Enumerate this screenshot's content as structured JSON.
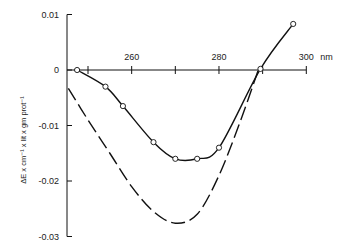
{
  "chart_data": {
    "type": "line",
    "title": "",
    "xlabel": "nm",
    "ylabel": "ΔE x cm⁻¹ x lit x gm prot⁻¹",
    "xlim": [
      245,
      300
    ],
    "ylim": [
      -0.03,
      0.01
    ],
    "x_ticks": [
      {
        "value": 250,
        "label": ""
      },
      {
        "value": 260,
        "label": "260"
      },
      {
        "value": 270,
        "label": ""
      },
      {
        "value": 280,
        "label": "280"
      },
      {
        "value": 290,
        "label": ""
      },
      {
        "value": 300,
        "label": "300"
      }
    ],
    "x_unit_label": "nm",
    "y_ticks": [
      {
        "value": 0.01,
        "label": "0.01"
      },
      {
        "value": 0,
        "label": "0"
      },
      {
        "value": -0.01,
        "label": "-0.01"
      },
      {
        "value": -0.02,
        "label": "-0.02"
      },
      {
        "value": -0.03,
        "label": "-0.03"
      }
    ],
    "grid": false,
    "legend": null,
    "series": [
      {
        "name": "solid-with-circles",
        "style": "solid",
        "marker": "open-circle",
        "x": [
          247.5,
          254,
          258,
          265,
          270,
          275,
          280,
          289.5,
          297
        ],
        "y": [
          0.0,
          -0.003,
          -0.0065,
          -0.013,
          -0.016,
          -0.016,
          -0.014,
          0.0002,
          0.0083
        ]
      },
      {
        "name": "dashed",
        "style": "dashed",
        "marker": "none",
        "x": [
          245.5,
          250,
          255,
          260,
          265,
          270,
          275,
          280,
          285,
          289
        ],
        "y": [
          -0.0033,
          -0.009,
          -0.015,
          -0.021,
          -0.0255,
          -0.0276,
          -0.026,
          -0.019,
          -0.009,
          0.0
        ]
      }
    ]
  }
}
